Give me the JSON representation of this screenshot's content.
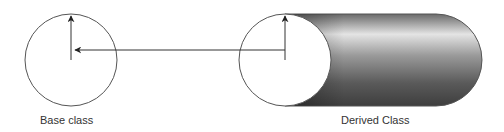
{
  "diagram": {
    "type": "inheritance-illustration",
    "base": {
      "label": "Base class",
      "shape": "circle"
    },
    "derived": {
      "label": "Derived Class",
      "shape": "cylinder"
    },
    "edges": [
      {
        "from": "derived",
        "to": "base",
        "style": "arrow"
      }
    ],
    "colors": {
      "stroke": "#333333",
      "cylinder_dark": "#3a3a3a",
      "cylinder_light": "#e8e8e8",
      "background": "#ffffff"
    }
  }
}
